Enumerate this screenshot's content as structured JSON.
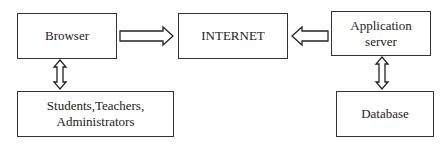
{
  "diagram": {
    "nodes": [
      {
        "id": "browser",
        "label": "Browser"
      },
      {
        "id": "internet",
        "label": "INTERNET"
      },
      {
        "id": "app_server",
        "label_line1": "Application",
        "label_line2": "server"
      },
      {
        "id": "users",
        "label_line1": "Students,Teachers,",
        "label_line2": "Administrators"
      },
      {
        "id": "database",
        "label": "Database"
      }
    ],
    "edges": [
      {
        "from": "browser",
        "to": "internet",
        "type": "one-way"
      },
      {
        "from": "app_server",
        "to": "internet",
        "type": "one-way"
      },
      {
        "from": "browser",
        "to": "users",
        "type": "two-way"
      },
      {
        "from": "app_server",
        "to": "database",
        "type": "two-way"
      }
    ]
  }
}
